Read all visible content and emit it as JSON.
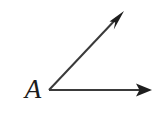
{
  "figure": {
    "kind": "angle-diagram",
    "background_color": "#ffffff",
    "stroke_color": "#3a3a3a",
    "label_color": "#1c1c1c",
    "vertex_label": "A",
    "vertex": {
      "x": 49,
      "y": 90
    },
    "rays": [
      {
        "name": "horizontal-ray",
        "from": {
          "x": 49,
          "y": 90
        },
        "to": {
          "x": 152,
          "y": 90
        },
        "arrowhead": "solid-triangle"
      },
      {
        "name": "diagonal-ray",
        "from": {
          "x": 49,
          "y": 90
        },
        "to": {
          "x": 124,
          "y": 11
        },
        "arrowhead": "solid-barbed"
      }
    ],
    "stroke_width": 2
  }
}
